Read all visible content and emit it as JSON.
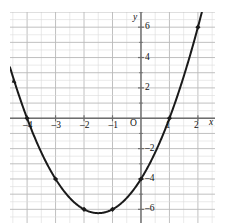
{
  "chart_data": {
    "type": "line",
    "title": "",
    "subtitle": "",
    "xlabel": "x",
    "ylabel": "y",
    "origin_label": "O",
    "grid": true,
    "grid_minor": true,
    "legend": "none",
    "xlim": [
      -4.6,
      2.6
    ],
    "ylim": [
      -6.9,
      7.0
    ],
    "xticks": [
      -4,
      -3,
      -2,
      -1,
      1,
      2
    ],
    "xtick_labels": [
      "–4",
      "–3",
      "–2",
      "–1",
      "1",
      "2"
    ],
    "yticks": [
      -6,
      -4,
      -2,
      2,
      4,
      6
    ],
    "ytick_labels": [
      "–6",
      "–4",
      "–2",
      "2",
      "4",
      "6"
    ],
    "xtick_step_major": 1,
    "ytick_step_major": 2,
    "minor_grid_step": 0.5,
    "curve": {
      "equation": "y = x^2 + 3x - 4",
      "vertex": [
        -1.5,
        -6.25
      ],
      "roots": [
        -4,
        1
      ],
      "y_intercept": -4,
      "color": "#1a1a1a",
      "line_width": 2.0
    },
    "points": [
      {
        "x": -4,
        "y": 0
      },
      {
        "x": -3,
        "y": -4
      },
      {
        "x": -2,
        "y": -6
      },
      {
        "x": -1,
        "y": -6
      },
      {
        "x": 0,
        "y": -4
      },
      {
        "x": 1,
        "y": 0
      },
      {
        "x": 2,
        "y": 6
      }
    ],
    "point_marker": "filled-diamond",
    "point_color": "#1a1a1a",
    "colors": {
      "background": "#ffffff",
      "grid_major": "#b9b9b9",
      "grid_minor": "#dcdcdc",
      "axis": "#6e6e6e",
      "text": "#101010"
    }
  }
}
